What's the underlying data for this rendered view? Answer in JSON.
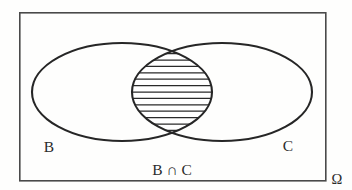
{
  "figure": {
    "type": "venn-diagram",
    "title": "",
    "background_color": "#fefefd",
    "stroke_color": "#262626",
    "rect_stroke_color": "#4a4a4a",
    "hatch_color": "#2a2a2a"
  },
  "labels": {
    "left_set": "B",
    "right_set": "C",
    "intersection": "B ∩ C",
    "universe": "Ω"
  },
  "geometry": {
    "rect": {
      "x": 19,
      "y": 12,
      "width": 306,
      "height": 168
    },
    "left_ellipse": {
      "cx": 122,
      "cy": 92,
      "rx": 90,
      "ry": 49
    },
    "right_ellipse": {
      "cx": 222,
      "cy": 92,
      "rx": 90,
      "ry": 49
    },
    "lens": {
      "cx": 172,
      "cy": 92,
      "top_y": 47,
      "bottom_y": 137,
      "half_width": 44
    },
    "hatch_line_count": 13,
    "hatch_spacing": 6.4
  },
  "label_positions": {
    "left_set": {
      "x": 49,
      "y": 152
    },
    "right_set": {
      "x": 288,
      "y": 151
    },
    "intersection": {
      "x": 172,
      "y": 175
    },
    "universe": {
      "x": 336,
      "y": 181
    }
  }
}
